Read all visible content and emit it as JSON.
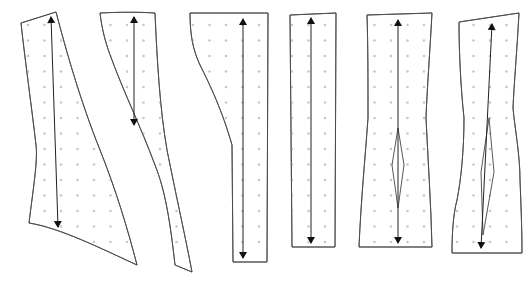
{
  "diagram": {
    "title": "",
    "colors": {
      "outline": "#4a4a4a",
      "grid_dot": "#c8c8c8",
      "grain_line": "#222222",
      "background": "#ffffff"
    },
    "pieces": [
      {
        "id": "piece-1",
        "path": "M21,23 L56,12 C66,50 80,100 100,150 C116,190 128,230 137,265 C100,248 60,228 29,223 C33,190 38,160 36,145 C32,110 25,60 21,23 Z",
        "grain": {
          "x1": 51,
          "y1": 17,
          "x2": 58,
          "y2": 227
        },
        "dart": null
      },
      {
        "id": "piece-2",
        "path": "M100,13 C120,12 140,12 155,13 C157,60 160,110 167,150 C176,195 186,240 192,272 L175,265 C170,220 165,190 155,165 C140,125 125,95 112,60 C106,45 102,30 100,13 Z",
        "grain": {
          "x1": 134,
          "y1": 17,
          "x2": 134,
          "y2": 125
        },
        "dart": null
      },
      {
        "id": "piece-3",
        "path": "M190,13 L268,13 L267,262 L233,262 L232,145 C222,110 210,85 200,65 C193,50 190,35 190,13 Z",
        "grain": {
          "x1": 243,
          "y1": 19,
          "x2": 243,
          "y2": 258
        },
        "dart": null
      },
      {
        "id": "piece-4",
        "path": "M290,15 L336,13 L335,247 L292,247 Z",
        "grain": {
          "x1": 311,
          "y1": 18,
          "x2": 311,
          "y2": 243
        },
        "dart": null
      },
      {
        "id": "piece-5",
        "path": "M367,15 L432,13 C430,50 427,90 426,118 C428,160 431,205 432,247 L359,247 C361,200 365,160 368,118 C368,80 368,45 367,15 Z",
        "grain": {
          "x1": 398,
          "y1": 20,
          "x2": 398,
          "y2": 243
        },
        "dart": "M398,128 L392,165 L398,208 L404,165 Z"
      },
      {
        "id": "piece-6",
        "path": "M459,22 L519,13 C517,50 514,85 513,108 C515,130 520,155 520,180 C521,205 522,230 522,253 L452,253 C452,235 453,215 457,200 C461,180 464,150 464,118 C461,90 459,55 459,22 Z",
        "grain": {
          "x1": 492,
          "y1": 24,
          "x2": 481,
          "y2": 248
        },
        "dart": "M489,118 L481,172 L483,235 L494,172 Z"
      }
    ],
    "grid": {
      "spacing": 16.5,
      "origin_x": 28,
      "origin_y": 25,
      "cols": 31,
      "rows": 15
    }
  }
}
